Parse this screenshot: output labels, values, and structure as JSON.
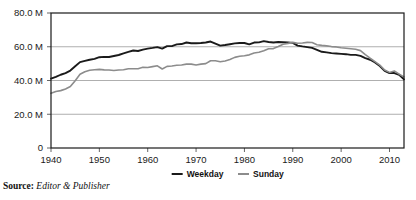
{
  "source": {
    "label": "Source:",
    "value": "Editor & Publisher"
  },
  "legend": {
    "position": "bottom-center",
    "items": [
      {
        "label": "Weekday",
        "color": "#1a1a1a",
        "swatch_name": "legend-swatch-weekday"
      },
      {
        "label": "Sunday",
        "color": "#8c8c8c",
        "swatch_name": "legend-swatch-sunday"
      }
    ]
  },
  "chart_data": {
    "type": "line",
    "title": "",
    "subtitle": "",
    "xlabel": "",
    "ylabel": "",
    "xlim": [
      1940,
      2013
    ],
    "ylim": [
      0,
      80000000
    ],
    "grid": true,
    "grid_axis": "y",
    "legend_position": "bottom-center",
    "y_ticks": [
      0,
      20000000,
      40000000,
      60000000,
      80000000
    ],
    "y_tick_labels": [
      "0",
      "20.0 M",
      "40.0 M",
      "60.0 M",
      "80.0 M"
    ],
    "x_ticks": [
      1940,
      1950,
      1960,
      1970,
      1980,
      1990,
      2000,
      2010
    ],
    "x_tick_labels": [
      "1940",
      "1950",
      "1960",
      "1970",
      "1980",
      "1990",
      "2000",
      "2010"
    ],
    "series": [
      {
        "name": "Weekday",
        "color": "#1a1a1a",
        "width": 1.9,
        "x": [
          1940,
          1941,
          1942,
          1943,
          1944,
          1945,
          1946,
          1947,
          1948,
          1949,
          1950,
          1951,
          1952,
          1953,
          1954,
          1955,
          1956,
          1957,
          1958,
          1959,
          1960,
          1961,
          1962,
          1963,
          1964,
          1965,
          1966,
          1967,
          1968,
          1969,
          1970,
          1971,
          1972,
          1973,
          1974,
          1975,
          1976,
          1977,
          1978,
          1979,
          1980,
          1981,
          1982,
          1983,
          1984,
          1985,
          1986,
          1987,
          1988,
          1989,
          1990,
          1991,
          1992,
          1993,
          1994,
          1995,
          1996,
          1997,
          1998,
          1999,
          2000,
          2001,
          2002,
          2003,
          2004,
          2005,
          2006,
          2007,
          2008,
          2009,
          2010,
          2011,
          2012,
          2013
        ],
        "values": [
          41100000,
          42100000,
          43400000,
          44400000,
          45900000,
          48400000,
          50900000,
          51600000,
          52300000,
          52800000,
          53800000,
          54000000,
          53900000,
          54500000,
          55100000,
          56100000,
          57000000,
          57800000,
          57500000,
          58300000,
          58900000,
          59300000,
          59800000,
          58900000,
          60400000,
          60400000,
          61400000,
          61600000,
          62500000,
          62100000,
          62100000,
          62200000,
          62500000,
          63100000,
          61900000,
          60700000,
          61000000,
          61500000,
          62000000,
          62200000,
          62200000,
          61400000,
          62500000,
          62600000,
          63300000,
          62800000,
          62500000,
          62800000,
          62700000,
          62600000,
          62300000,
          60700000,
          60200000,
          59800000,
          59300000,
          58200000,
          57000000,
          56700000,
          56200000,
          56000000,
          55800000,
          55600000,
          55200000,
          55200000,
          54600000,
          53300000,
          52300000,
          50700000,
          48600000,
          45700000,
          44400000,
          44400000,
          43400000,
          40700000
        ]
      },
      {
        "name": "Sunday",
        "color": "#8c8c8c",
        "width": 1.6,
        "x": [
          1940,
          1941,
          1942,
          1943,
          1944,
          1945,
          1946,
          1947,
          1948,
          1949,
          1950,
          1951,
          1952,
          1953,
          1954,
          1955,
          1956,
          1957,
          1958,
          1959,
          1960,
          1961,
          1962,
          1963,
          1964,
          1965,
          1966,
          1967,
          1968,
          1969,
          1970,
          1971,
          1972,
          1973,
          1974,
          1975,
          1976,
          1977,
          1978,
          1979,
          1980,
          1981,
          1982,
          1983,
          1984,
          1985,
          1986,
          1987,
          1988,
          1989,
          1990,
          1991,
          1992,
          1993,
          1994,
          1995,
          1996,
          1997,
          1998,
          1999,
          2000,
          2001,
          2002,
          2003,
          2004,
          2005,
          2006,
          2007,
          2008,
          2009,
          2010,
          2011,
          2012,
          2013
        ],
        "values": [
          32400000,
          33500000,
          34000000,
          35000000,
          36400000,
          39900000,
          43700000,
          45200000,
          46100000,
          46400000,
          46600000,
          46300000,
          46200000,
          45900000,
          46200000,
          46400000,
          47000000,
          47000000,
          47000000,
          47800000,
          47700000,
          48200000,
          48700000,
          46800000,
          48400000,
          48600000,
          49000000,
          49200000,
          49700000,
          49700000,
          49200000,
          49700000,
          50000000,
          51700000,
          51700000,
          51100000,
          51600000,
          52400000,
          53700000,
          54400000,
          54700000,
          55200000,
          56300000,
          56700000,
          57600000,
          58800000,
          58900000,
          60100000,
          61500000,
          62000000,
          62600000,
          62100000,
          62200000,
          62600000,
          62500000,
          61200000,
          60800000,
          60500000,
          60100000,
          59900000,
          59400000,
          59100000,
          58800000,
          58500000,
          57700000,
          55300000,
          53200000,
          51200000,
          49100000,
          46200000,
          44800000,
          45600000,
          43800000,
          42100000
        ]
      }
    ]
  },
  "axes": {
    "plot_left": 51,
    "plot_right": 404,
    "plot_top": 13,
    "plot_bottom": 148
  }
}
